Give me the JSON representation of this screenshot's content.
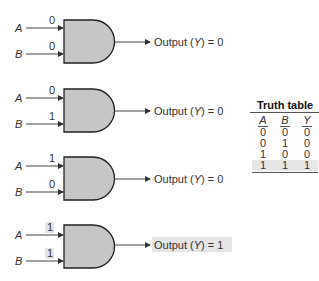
{
  "colors": {
    "gate_fill": "#c6c6c6",
    "gate_stroke": "#222222",
    "wire": "#444444",
    "highlight": "#e6e6e6"
  },
  "gates": [
    {
      "a_label": "A",
      "b_label": "B",
      "a_value": "0",
      "b_value": "0",
      "output_text": "Output (Y) = 0",
      "output_value": "0",
      "highlighted": false
    },
    {
      "a_label": "A",
      "b_label": "B",
      "a_value": "0",
      "b_value": "1",
      "output_text": "Output (Y) = 0",
      "output_value": "0",
      "highlighted": false
    },
    {
      "a_label": "A",
      "b_label": "B",
      "a_value": "1",
      "b_value": "0",
      "output_text": "Output (Y) = 0",
      "output_value": "0",
      "highlighted": false
    },
    {
      "a_label": "A",
      "b_label": "B",
      "a_value": "1",
      "b_value": "1",
      "output_text": "Output (Y) = 1",
      "output_value": "1",
      "highlighted": true
    }
  ],
  "output_prefix": "Output (",
  "output_var": "Y",
  "output_mid": ") = ",
  "truth_table": {
    "title": "Truth table",
    "headers": [
      "A",
      "B",
      "Y"
    ],
    "rows": [
      [
        "0",
        "0",
        "0"
      ],
      [
        "0",
        "1",
        "0"
      ],
      [
        "1",
        "0",
        "0"
      ],
      [
        "1",
        "1",
        "1"
      ]
    ],
    "highlighted_row": 3
  }
}
